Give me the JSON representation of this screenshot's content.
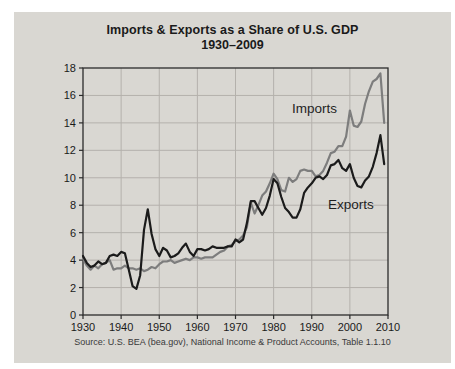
{
  "colors": {
    "card_bg": "#d9d7d2",
    "grid": "#b4b1ac",
    "axis": "#2b2b2b",
    "text": "#1a1a1a",
    "imports_line": "#7d7d7d",
    "exports_line": "#1b1b1b"
  },
  "source_note": "Source: U.S. BEA (bea.gov), National Income & Product Accounts, Table 1.1.10",
  "chart_data": {
    "type": "line",
    "title": "Imports & Exports as a Share of U.S. GDP",
    "subtitle": "1930–2009",
    "xlabel": "",
    "ylabel": "",
    "xlim": [
      1930,
      2010
    ],
    "ylim": [
      0,
      18
    ],
    "xticks": [
      1930,
      1940,
      1950,
      1960,
      1970,
      1980,
      1990,
      2000,
      2010
    ],
    "yticks": [
      0,
      2,
      4,
      6,
      8,
      10,
      12,
      14,
      16,
      18
    ],
    "grid": true,
    "legend": "inline-annotations",
    "years": [
      1930,
      1931,
      1932,
      1933,
      1934,
      1935,
      1936,
      1937,
      1938,
      1939,
      1940,
      1941,
      1942,
      1943,
      1944,
      1945,
      1946,
      1947,
      1948,
      1949,
      1950,
      1951,
      1952,
      1953,
      1954,
      1955,
      1956,
      1957,
      1958,
      1959,
      1960,
      1961,
      1962,
      1963,
      1964,
      1965,
      1966,
      1967,
      1968,
      1969,
      1970,
      1971,
      1972,
      1973,
      1974,
      1975,
      1976,
      1977,
      1978,
      1979,
      1980,
      1981,
      1982,
      1983,
      1984,
      1985,
      1986,
      1987,
      1988,
      1989,
      1990,
      1991,
      1992,
      1993,
      1994,
      1995,
      1996,
      1997,
      1998,
      1999,
      2000,
      2001,
      2002,
      2003,
      2004,
      2005,
      2006,
      2007,
      2008,
      2009
    ],
    "series": [
      {
        "name": "Imports",
        "color": "#7d7d7d",
        "values": [
          4.1,
          3.6,
          3.3,
          3.6,
          3.4,
          3.7,
          3.8,
          4.0,
          3.3,
          3.4,
          3.4,
          3.6,
          3.4,
          3.4,
          3.3,
          3.4,
          3.2,
          3.3,
          3.5,
          3.4,
          3.7,
          3.9,
          3.9,
          4.0,
          3.8,
          3.9,
          4.0,
          4.1,
          4.0,
          4.2,
          4.2,
          4.1,
          4.2,
          4.2,
          4.2,
          4.4,
          4.6,
          4.7,
          5.0,
          5.1,
          5.4,
          5.5,
          5.8,
          6.4,
          8.2,
          7.4,
          8.0,
          8.7,
          9.0,
          9.6,
          10.3,
          9.9,
          9.1,
          9.0,
          10.0,
          9.7,
          9.9,
          10.5,
          10.6,
          10.5,
          10.5,
          10.1,
          10.2,
          10.5,
          11.1,
          11.8,
          11.9,
          12.3,
          12.3,
          13.0,
          14.9,
          13.8,
          13.7,
          14.1,
          15.4,
          16.3,
          17.0,
          17.2,
          17.6,
          14.0
        ]
      },
      {
        "name": "Exports",
        "color": "#1b1b1b",
        "values": [
          4.3,
          3.8,
          3.5,
          3.6,
          3.9,
          3.7,
          3.8,
          4.3,
          4.4,
          4.3,
          4.6,
          4.5,
          3.3,
          2.1,
          1.9,
          2.9,
          6.2,
          7.7,
          5.9,
          4.8,
          4.3,
          4.9,
          4.7,
          4.2,
          4.3,
          4.5,
          4.9,
          5.2,
          4.6,
          4.3,
          4.8,
          4.8,
          4.7,
          4.8,
          5.0,
          4.9,
          4.9,
          4.9,
          5.0,
          5.0,
          5.5,
          5.3,
          5.5,
          6.7,
          8.3,
          8.3,
          7.8,
          7.3,
          7.8,
          8.7,
          9.9,
          9.6,
          8.6,
          7.8,
          7.5,
          7.1,
          7.1,
          7.7,
          8.9,
          9.3,
          9.6,
          10.0,
          10.1,
          9.9,
          10.2,
          10.9,
          11.0,
          11.3,
          10.7,
          10.5,
          11.0,
          10.0,
          9.4,
          9.3,
          9.8,
          10.1,
          10.8,
          11.8,
          13.1,
          11.0
        ]
      }
    ]
  }
}
